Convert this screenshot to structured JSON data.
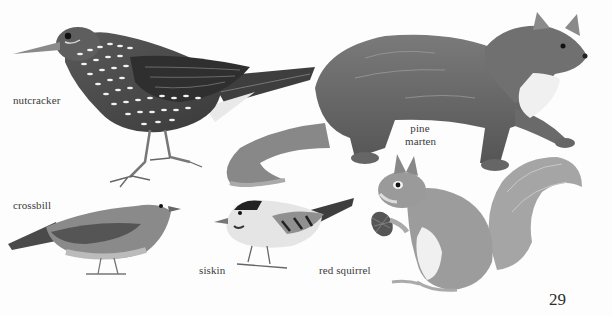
{
  "page": {
    "page_number": "29",
    "background": "#fdfdfd"
  },
  "captions": {
    "nutcracker": "nutcracker",
    "pine_marten_line1": "pine",
    "pine_marten_line2": "marten",
    "crossbill": "crossbill",
    "siskin": "siskin",
    "red_squirrel": "red squirrel"
  },
  "illustrations": [
    {
      "id": "nutcracker",
      "label": "nutcracker",
      "style": "grayscale drawing, dark plumage with white spots"
    },
    {
      "id": "pine-marten",
      "label": "pine marten",
      "style": "grayscale drawing, light throat patch"
    },
    {
      "id": "crossbill",
      "label": "crossbill",
      "style": "grayscale drawing"
    },
    {
      "id": "siskin",
      "label": "siskin",
      "style": "grayscale drawing, dark cap"
    },
    {
      "id": "red-squirrel",
      "label": "red squirrel",
      "style": "grayscale drawing, holding pine cone"
    }
  ],
  "colors": {
    "ink_dark": "#3c3c3c",
    "ink_mid": "#6e6e6e",
    "ink_light": "#a8a8a8",
    "text": "#3a3a3a"
  }
}
